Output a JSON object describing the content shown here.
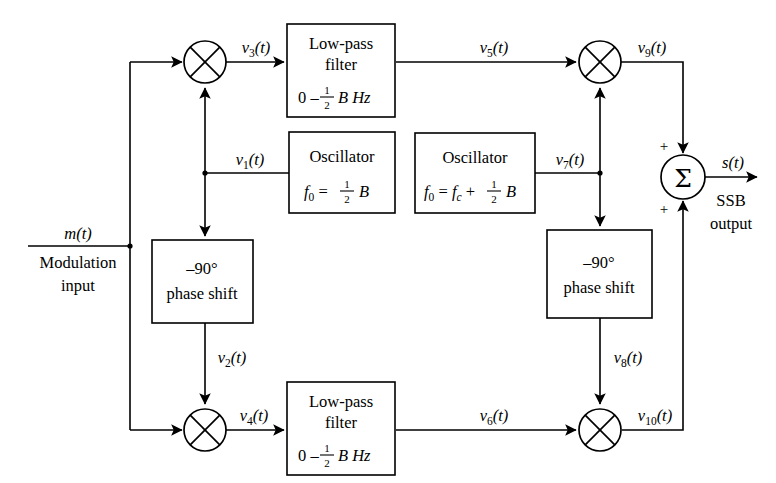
{
  "diagram": {
    "input": {
      "signal": "m(t)",
      "caption_line1": "Modulation",
      "caption_line2": "input"
    },
    "output": {
      "signal": "s(t)",
      "caption_line1": "SSB",
      "caption_line2": "output"
    },
    "blocks": [
      {
        "id": "lpf-top",
        "kind": "low-pass-filter",
        "line1": "Low-pass",
        "line2": "filter",
        "line3_prefix": "0 – ",
        "line3_num": "1",
        "line3_den": "2",
        "line3_suffix": "B Hz"
      },
      {
        "id": "osc-left",
        "kind": "oscillator",
        "line1": "Oscillator",
        "line2_lhs": "f",
        "line2_lhs_sub": "0",
        "line2_eq": " = ",
        "line2_num": "1",
        "line2_den": "2",
        "line2_suffix": "B"
      },
      {
        "id": "osc-right",
        "kind": "oscillator",
        "line1": "Oscillator",
        "line2_lhs": "f",
        "line2_lhs_sub": "0",
        "line2_eq": " = ",
        "line2_term": "f",
        "line2_term_sub": "c",
        "line2_plus": " + ",
        "line2_num": "1",
        "line2_den": "2",
        "line2_suffix": "B"
      },
      {
        "id": "phase-left",
        "kind": "phase-shift",
        "line1": "–90°",
        "line2": "phase shift"
      },
      {
        "id": "phase-right",
        "kind": "phase-shift",
        "line1": "–90°",
        "line2": "phase shift"
      },
      {
        "id": "lpf-bottom",
        "kind": "low-pass-filter",
        "line1": "Low-pass",
        "line2": "filter",
        "line3_prefix": "0 – ",
        "line3_num": "1",
        "line3_den": "2",
        "line3_suffix": "B Hz"
      }
    ],
    "mixers": [
      {
        "id": "mixer-1",
        "name": "multiplier-top-left"
      },
      {
        "id": "mixer-2",
        "name": "multiplier-bottom-left"
      },
      {
        "id": "mixer-3",
        "name": "multiplier-top-right"
      },
      {
        "id": "mixer-4",
        "name": "multiplier-bottom-right"
      }
    ],
    "summer": {
      "id": "summer",
      "glyph": "Σ",
      "sign_top": "+",
      "sign_bottom": "+"
    },
    "signals": [
      {
        "id": "v1",
        "base": "v",
        "sub": "1",
        "suffix": "(t)",
        "text": "v1(t)"
      },
      {
        "id": "v2",
        "base": "v",
        "sub": "2",
        "suffix": "(t)",
        "text": "v2(t)"
      },
      {
        "id": "v3",
        "base": "v",
        "sub": "3",
        "suffix": "(t)",
        "text": "v3(t)"
      },
      {
        "id": "v4",
        "base": "v",
        "sub": "4",
        "suffix": "(t)",
        "text": "v4(t)"
      },
      {
        "id": "v5",
        "base": "v",
        "sub": "5",
        "suffix": "(t)",
        "text": "v5(t)"
      },
      {
        "id": "v6",
        "base": "v",
        "sub": "6",
        "suffix": "(t)",
        "text": "v6(t)"
      },
      {
        "id": "v7",
        "base": "v",
        "sub": "7",
        "suffix": "(t)",
        "text": "v7(t)"
      },
      {
        "id": "v8",
        "base": "v",
        "sub": "8",
        "suffix": "(t)",
        "text": "v8(t)"
      },
      {
        "id": "v9",
        "base": "v",
        "sub": "9",
        "suffix": "(t)",
        "text": "v9(t)"
      },
      {
        "id": "v10",
        "base": "v",
        "sub": "10",
        "suffix": "(t)",
        "text": "v10(t)"
      }
    ],
    "colors": {
      "stroke": "#000000",
      "background": "#ffffff",
      "text": "#000000"
    }
  }
}
